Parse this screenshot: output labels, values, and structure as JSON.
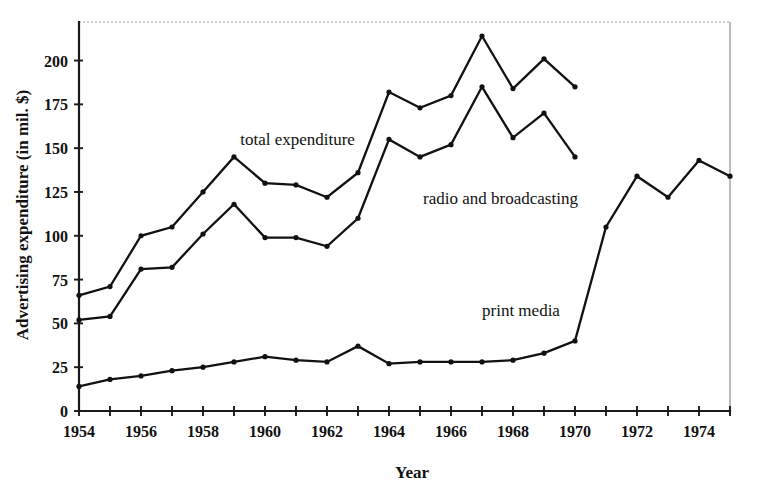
{
  "chart_data": {
    "type": "line",
    "title": "",
    "xlabel": "Year",
    "ylabel": "Advertising expenditure (in mil. $)",
    "xlim": [
      1954,
      1975
    ],
    "ylim": [
      0,
      222
    ],
    "y_axis_max_tick": 200,
    "grid": false,
    "legend_position": "inline-annotations",
    "x_tick_step": 1,
    "x_label_step": 2,
    "y_ticks": [
      0,
      25,
      50,
      75,
      100,
      125,
      150,
      175,
      200
    ],
    "y_tick_labels": [
      "0",
      "25",
      "50",
      "75",
      "100",
      "125",
      "150",
      "175",
      "200"
    ],
    "x_ticks": [
      1954,
      1955,
      1956,
      1957,
      1958,
      1959,
      1960,
      1961,
      1962,
      1963,
      1964,
      1965,
      1966,
      1967,
      1968,
      1969,
      1970,
      1971,
      1972,
      1973,
      1974,
      1975
    ],
    "x_tick_labels": [
      "1954",
      "",
      "1956",
      "",
      "1958",
      "",
      "1960",
      "",
      "1962",
      "",
      "1964",
      "",
      "1966",
      "",
      "1968",
      "",
      "1970",
      "",
      "1972",
      "",
      "1974",
      ""
    ],
    "series": [
      {
        "name": "total expenditure",
        "label": "total expenditure",
        "label_x": 1959.2,
        "label_y": 152,
        "color": "#111111",
        "x": [
          1954,
          1955,
          1956,
          1957,
          1958,
          1959,
          1960,
          1961,
          1962,
          1963,
          1964,
          1965,
          1966,
          1967,
          1968,
          1969,
          1970
        ],
        "values": [
          66,
          71,
          100,
          105,
          125,
          145,
          130,
          129,
          122,
          136,
          182,
          173,
          180,
          214,
          184,
          201,
          185
        ]
      },
      {
        "name": "radio and broadcasting",
        "label": "radio and broadcasting",
        "label_x": 1965.1,
        "label_y": 118,
        "color": "#111111",
        "x": [
          1954,
          1955,
          1956,
          1957,
          1958,
          1959,
          1960,
          1961,
          1962,
          1963,
          1964,
          1965,
          1966,
          1967,
          1968,
          1969,
          1970
        ],
        "values": [
          52,
          54,
          81,
          82,
          101,
          118,
          99,
          99,
          94,
          110,
          155,
          145,
          152,
          185,
          156,
          170,
          145
        ]
      },
      {
        "name": "print media",
        "label": "print media",
        "label_x": 1967.0,
        "label_y": 54,
        "color": "#111111",
        "x": [
          1954,
          1955,
          1956,
          1957,
          1958,
          1959,
          1960,
          1961,
          1962,
          1963,
          1964,
          1965,
          1966,
          1967,
          1968,
          1969,
          1970,
          1971,
          1972,
          1973,
          1974,
          1975
        ],
        "values": [
          14,
          18,
          20,
          23,
          25,
          28,
          31,
          29,
          28,
          37,
          27,
          28,
          28,
          28,
          29,
          33,
          40,
          105,
          134,
          122,
          143,
          134
        ]
      }
    ]
  },
  "axis": {
    "y_title": "Advertising expenditure (in mil. $)",
    "x_title": "Year"
  }
}
